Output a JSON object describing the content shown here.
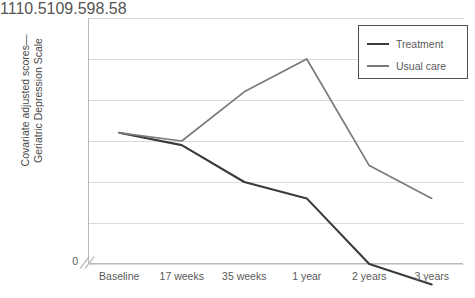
{
  "chart_data": {
    "type": "line",
    "title": "",
    "xlabel": "",
    "ylabel": "Covariate adjusted scores—\nGeriatric Depression Scale",
    "categories": [
      "Baseline",
      "17 weeks",
      "35 weeks",
      "1 year",
      "2 years",
      "3 years"
    ],
    "yticks": [
      "11",
      "10.5",
      "10",
      "9.5",
      "9",
      "8.5",
      "8"
    ],
    "ytick_values": [
      11,
      10.5,
      10,
      9.5,
      9,
      8.5,
      8
    ],
    "ylim": [
      8,
      11
    ],
    "axis_break": true,
    "axis_break_label": "0",
    "grid": "horizontal",
    "legend_position": "top-right",
    "series": [
      {
        "name": "Treatment",
        "color": "#3a3a3a",
        "values": [
          9.6,
          9.45,
          9.0,
          8.8,
          8.0,
          7.75
        ]
      },
      {
        "name": "Usual care",
        "color": "#7a7a7a",
        "values": [
          9.6,
          9.5,
          10.1,
          10.5,
          9.2,
          8.8
        ]
      }
    ]
  },
  "legend": {
    "items": [
      {
        "label": "Treatment"
      },
      {
        "label": "Usual care"
      }
    ]
  }
}
